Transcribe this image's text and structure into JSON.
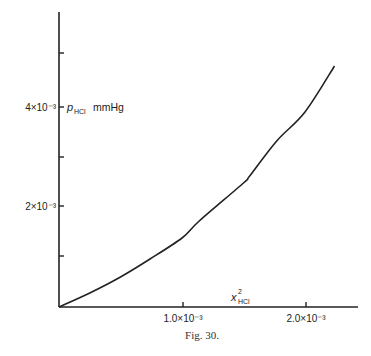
{
  "chart_data": {
    "type": "line",
    "title": "",
    "caption": "Fig. 30.",
    "xlabel": "x²_HCl",
    "xlabel_main": "x",
    "xlabel_sup": "2",
    "xlabel_sub": "HCl",
    "ylabel": "p_HCl mmHg",
    "ylabel_main": "p",
    "ylabel_sub": "HCl",
    "ylabel_unit": "mmHg",
    "x_ticks": [
      0.0,
      0.001,
      0.002
    ],
    "x_tick_labels": [
      "1.0×10⁻³",
      "2.0×10⁻³"
    ],
    "y_ticks": [
      0.001,
      0.002,
      0.003,
      0.004,
      0.005
    ],
    "y_tick_labels": [
      "2×10⁻³",
      "4×10⁻³"
    ],
    "xlim": [
      0,
      0.00242
    ],
    "ylim": [
      0,
      0.0059
    ],
    "grid": false,
    "legend": null,
    "series": [
      {
        "name": "p_HCl vs x²_HCl",
        "x": [
          0.0,
          0.00025,
          0.0005,
          0.00074,
          0.001,
          0.00114,
          0.0015,
          0.00155,
          0.00177,
          0.002,
          0.00224
        ],
        "y": [
          0.0,
          0.00028,
          0.0006,
          0.00096,
          0.00138,
          0.00172,
          0.00248,
          0.00262,
          0.00332,
          0.0039,
          0.00482
        ]
      }
    ]
  }
}
